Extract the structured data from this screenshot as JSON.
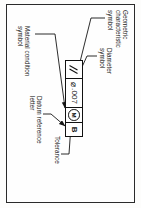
{
  "figure": {
    "rotation_degrees": 90,
    "feature_control_frame": {
      "cells": [
        {
          "name": "geometric-characteristic-symbol",
          "value": "∥",
          "type": "symbol"
        },
        {
          "name": "tolerance-value",
          "value": ".007",
          "prefix": "⌀",
          "type": "text"
        },
        {
          "name": "material-condition-symbol",
          "value": "M",
          "type": "circled-letter"
        },
        {
          "name": "datum-reference-letter",
          "value": "B",
          "type": "letter"
        }
      ]
    },
    "labels": [
      {
        "id": "geometric",
        "text": "Geometric\ncharacteristic\nsymbol"
      },
      {
        "id": "diameter",
        "text": "Diameter\nsymbol"
      },
      {
        "id": "tolerance",
        "text": "Tolerance"
      },
      {
        "id": "datum",
        "text": "Datum reference\nletter"
      },
      {
        "id": "material",
        "text": "Material condition\nsymbol"
      }
    ]
  },
  "colors": {
    "ink": "#151515",
    "border": "#2b2b2b",
    "paper": "#fefefe"
  }
}
